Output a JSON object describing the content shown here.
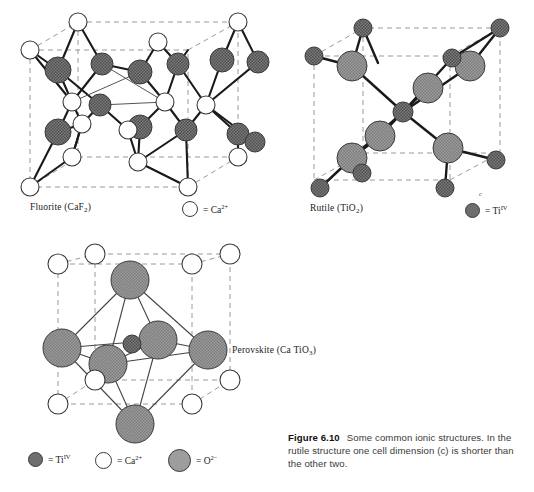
{
  "figure": {
    "number_label": "Figure 6.10",
    "caption_text": "Some common ionic structures. In the rutile structure one cell dimension (c) is shorter than the other two."
  },
  "colors": {
    "open_circle_fill": "#ffffff",
    "open_circle_stroke": "#3a3a3a",
    "dark_sphere_fill": "#6e6e6e",
    "mid_sphere_fill": "#8c8c8c",
    "bond_stroke": "#1a1a1a",
    "thin_bond_stroke": "#555555",
    "cell_edge_dashed": "#9a9a9a",
    "caption_text_color": "#3a3a3a"
  },
  "structures": [
    {
      "id": "fluorite",
      "name_plain": "Fluorite (CaF2)",
      "name_main": "Fluorite (CaF",
      "name_sub": "2",
      "name_tail": ")",
      "legend": [
        {
          "swatch": "open-circle",
          "text_prefix": "= Ca",
          "sup": "2+",
          "plain": "= Ca2+"
        }
      ]
    },
    {
      "id": "rutile",
      "name_plain": "Rutile (TiO2)",
      "name_main": "Rutile (TiO",
      "name_sub": "2",
      "name_tail": ")",
      "axis_label": "c",
      "legend": [
        {
          "swatch": "dark-circle",
          "text_prefix": "= Ti",
          "sup": "IV",
          "plain": "= Ti IV"
        }
      ]
    },
    {
      "id": "perovskite",
      "name_plain": "Perovskite (Ca TiO3)",
      "name_main": "Perovskite (Ca TiO",
      "name_sub": "3",
      "name_tail": ")",
      "legend": [
        {
          "swatch": "dark-circle",
          "text_prefix": "= Ti",
          "sup": "IV",
          "plain": "= Ti IV"
        },
        {
          "swatch": "open-circle",
          "text_prefix": "= Ca",
          "sup": "2+",
          "plain": "= Ca2+"
        },
        {
          "swatch": "mid-circle",
          "text_prefix": "= O",
          "sup": "2−",
          "plain": "= O2-"
        }
      ]
    }
  ]
}
